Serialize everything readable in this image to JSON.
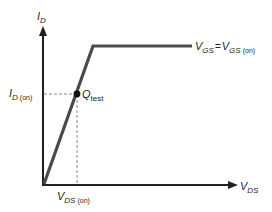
{
  "diagram": {
    "type": "mosfet-drain-curve",
    "colors": {
      "axis": "#231f20",
      "curve": "#4a4a4a",
      "dashed": "#8a8a8a",
      "text": "#231f20"
    },
    "y_axis": {
      "label_main": "I",
      "label_sub": "D"
    },
    "x_axis": {
      "label_main": "V",
      "label_sub": "DS"
    },
    "curve_label": {
      "left_main": "V",
      "left_sub": "GS",
      "equals": "=",
      "right_main": "V",
      "right_sub": "GS",
      "right_sub2": "(on)"
    },
    "q_point": {
      "label_main": "Q",
      "label_sub": "test"
    },
    "id_on_label": {
      "main": "I",
      "sub": "D",
      "sub2": "(on)"
    },
    "vds_on_label": {
      "main": "V",
      "sub": "DS",
      "sub2": "(on)"
    }
  }
}
